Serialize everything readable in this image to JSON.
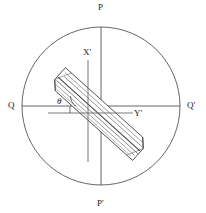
{
  "figure": {
    "background_color": "#ffffff",
    "line_color": "#555555",
    "rod_outline_color": "#4a4a4a",
    "rod_hatch_color": "#6e6e6e",
    "text_color": "#1a1a1a"
  },
  "labels": {
    "top": "P",
    "bottom": "P'",
    "left": "Q",
    "right": "Q'",
    "axis_x_prime": "X'",
    "axis_y_prime": "Y'",
    "angle": "θ"
  },
  "geometry": {
    "circle": {
      "cx": 101,
      "cy": 106,
      "r": 79
    },
    "vertical_diameter": {
      "x": 101,
      "y1": 27,
      "y2": 185
    },
    "horizontal_diameter": {
      "y": 106,
      "x1": 22,
      "x2": 180
    },
    "axis_x_prime": {
      "x": 88,
      "y1": 60,
      "y2": 162
    },
    "axis_y_prime": {
      "y": 113,
      "x1": 48,
      "x2": 133
    },
    "angle_value_deg": 42,
    "rod": {
      "angle_deg": 42,
      "length": 112,
      "width": 24,
      "center_x": 99,
      "center_y": 114,
      "hatch_lines": 6
    }
  }
}
